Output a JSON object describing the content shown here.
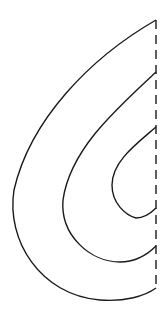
{
  "diagram": {
    "stroke_color": "#1a1a1a",
    "background": "#ffffff",
    "axis": {
      "x": 156,
      "y_top": 20,
      "y_bottom": 290,
      "style": "dashed"
    },
    "curves": [
      {
        "name": "outer",
        "top": [
          156,
          20
        ],
        "leftmost": [
          12,
          215
        ],
        "bottom": [
          156,
          288
        ]
      },
      {
        "name": "middle",
        "top": [
          156,
          72
        ],
        "leftmost": [
          63,
          205
        ],
        "bottom": [
          156,
          246
        ]
      },
      {
        "name": "inner",
        "top": [
          156,
          127
        ],
        "leftmost": [
          112,
          180
        ],
        "bottom": [
          156,
          208
        ]
      }
    ]
  }
}
